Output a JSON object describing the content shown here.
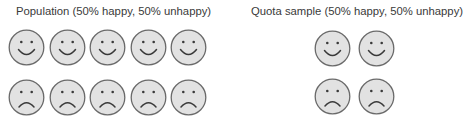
{
  "panels": [
    {
      "title": "Population (50% happy, 50% unhappy)",
      "rows": [
        {
          "mood": "happy",
          "count": 5
        },
        {
          "mood": "unhappy",
          "count": 5
        }
      ]
    },
    {
      "title": "Quota sample (50% happy, 50% unhappy)",
      "rows": [
        {
          "mood": "happy",
          "count": 2
        },
        {
          "mood": "unhappy",
          "count": 2
        }
      ]
    }
  ],
  "colors": {
    "face_fill": "#e2e2e2",
    "face_stroke": "#6a6a6a",
    "feature": "#3a3a3a"
  }
}
